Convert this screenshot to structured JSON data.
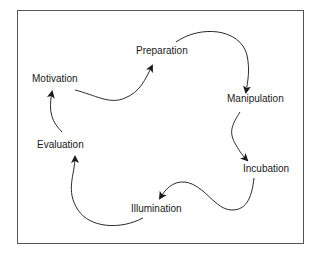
{
  "diagram": {
    "type": "cycle",
    "stages": [
      {
        "id": "motivation",
        "label": "Motivation"
      },
      {
        "id": "preparation",
        "label": "Preparation"
      },
      {
        "id": "manipulation",
        "label": "Manipulation"
      },
      {
        "id": "incubation",
        "label": "Incubation"
      },
      {
        "id": "illumination",
        "label": "Illumination"
      },
      {
        "id": "evaluation",
        "label": "Evaluation"
      }
    ],
    "edges": [
      {
        "from": "motivation",
        "to": "preparation"
      },
      {
        "from": "preparation",
        "to": "manipulation"
      },
      {
        "from": "manipulation",
        "to": "incubation"
      },
      {
        "from": "incubation",
        "to": "illumination"
      },
      {
        "from": "illumination",
        "to": "evaluation"
      },
      {
        "from": "evaluation",
        "to": "motivation"
      }
    ],
    "colors": {
      "line": "#2a2a2a",
      "border": "#555555",
      "text": "#1a1a1a"
    }
  }
}
